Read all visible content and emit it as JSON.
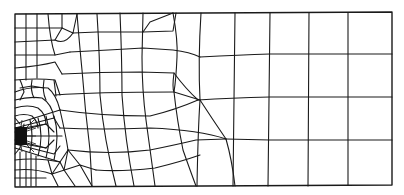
{
  "diagram": {
    "type": "finite-element-mesh",
    "stroke_color": "#1a1a1a",
    "background_color": "#ffffff",
    "singular_point_fill": "#111111",
    "domain_bounds": {
      "left": 15,
      "top": 13,
      "right": 392,
      "bottom": 185
    },
    "refinement_point": {
      "x": 18,
      "y": 136
    },
    "coarse_region": {
      "vertical_lines_x": [
        235,
        270,
        309,
        348,
        392
      ],
      "horizontal_lines_y": [
        13,
        54,
        97,
        140,
        185
      ]
    }
  }
}
